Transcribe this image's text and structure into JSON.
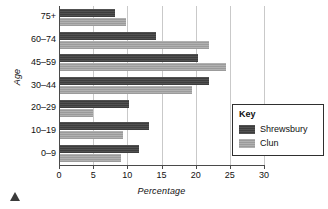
{
  "chart_data": {
    "type": "bar",
    "orientation": "horizontal",
    "title": "",
    "xlabel": "Percentage",
    "ylabel": "Age",
    "categories": [
      "0–9",
      "10–19",
      "20–29",
      "30–44",
      "45–59",
      "60–74",
      "75+"
    ],
    "series": [
      {
        "name": "Shrewsbury",
        "color": "#3d3d3d",
        "values": [
          11.7,
          13.1,
          10.2,
          22.0,
          20.3,
          14.2,
          8.2
        ]
      },
      {
        "name": "Clun",
        "color": "#9b9b9b",
        "values": [
          9.0,
          9.4,
          5.0,
          19.4,
          24.5,
          22.0,
          9.8
        ]
      }
    ],
    "xlim": [
      0,
      30
    ],
    "xticks": [
      0,
      5,
      10,
      15,
      20,
      25,
      30
    ],
    "xtick_labels": [
      "0",
      "5",
      "10",
      "15",
      "20",
      "25",
      "30"
    ],
    "grid": "vertical",
    "legend": {
      "title": "Key",
      "position": "inside-right"
    }
  },
  "legend": {
    "title": "Key",
    "entries": [
      {
        "label": "Shrewsbury",
        "swatch": "shrewsbury"
      },
      {
        "label": "Clun",
        "swatch": "clun"
      }
    ]
  },
  "axes": {
    "x_title": "Percentage",
    "y_title": "Age"
  },
  "marker": {
    "name": "triangle-marker"
  }
}
